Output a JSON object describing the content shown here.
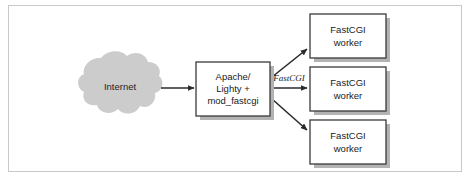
{
  "figure": {
    "background_color": "#ffffff",
    "frame_color": "#c9c9c9"
  },
  "colors": {
    "cloud_fill": "#cccccc",
    "box_fill": "#ffffff",
    "box_stroke": "#3a3a3a",
    "shadow": "#b3b3b3",
    "arrow": "#2b2b2b",
    "text": "#1a1a1a"
  },
  "nodes": {
    "internet": {
      "label": "Internet",
      "shape": "cloud"
    },
    "server": {
      "shape": "box",
      "lines": [
        "Apache/",
        "Lighty +",
        "mod_fastcgi"
      ],
      "line1": "Apache/",
      "line2": "Lighty +",
      "line3": "mod_fastcgi"
    },
    "worker_top": {
      "shape": "box",
      "line1": "FastCGI",
      "line2": "worker"
    },
    "worker_middle": {
      "shape": "box",
      "line1": "FastCGI",
      "line2": "worker"
    },
    "worker_bottom": {
      "shape": "box",
      "line1": "FastCGI",
      "line2": "worker"
    }
  },
  "edges": {
    "internet_to_server": {
      "label": "",
      "style": "solid-arrow"
    },
    "server_to_worker_top": {
      "label": "",
      "style": "solid-arrow"
    },
    "server_to_worker_middle": {
      "label": "FastCGI",
      "style": "solid-arrow"
    },
    "server_to_worker_bottom": {
      "label": "",
      "style": "solid-arrow"
    }
  }
}
